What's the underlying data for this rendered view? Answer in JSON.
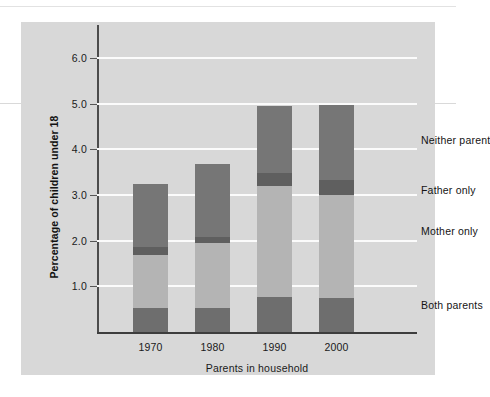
{
  "chart_data": {
    "type": "bar",
    "subtype": "stacked-bar",
    "title": "",
    "xlabel": "Parents in household",
    "ylabel": "Percentage of children under 18",
    "categories": [
      "1970",
      "1980",
      "1990",
      "2000"
    ],
    "ylim": [
      0,
      6.4
    ],
    "yticks": [
      "1.0",
      "2.0",
      "3.0",
      "4.0",
      "5.0",
      "6.0"
    ],
    "ytick_values": [
      1.0,
      2.0,
      3.0,
      4.0,
      5.0,
      6.0
    ],
    "grid": "horizontal-white",
    "legend_position": "right-inline",
    "series": [
      {
        "name": "Both parents",
        "color": "#6e6e6e",
        "values": [
          0.53,
          0.52,
          0.76,
          0.74
        ]
      },
      {
        "name": "Mother only",
        "color": "#b4b4b4",
        "values": [
          1.16,
          1.43,
          2.43,
          2.25
        ]
      },
      {
        "name": "Father only",
        "color": "#5f5f5f",
        "values": [
          0.17,
          0.12,
          0.3,
          0.33
        ]
      },
      {
        "name": "Neither parent",
        "color": "#767676",
        "values": [
          1.38,
          1.6,
          1.46,
          1.64
        ]
      }
    ],
    "cumulative_tops": {
      "1970": [
        0.53,
        1.69,
        1.86,
        3.24
      ],
      "1980": [
        0.52,
        1.95,
        2.07,
        3.67
      ],
      "1990": [
        0.76,
        3.19,
        3.49,
        4.95
      ],
      "2000": [
        0.74,
        2.99,
        3.32,
        4.96
      ]
    },
    "legend": [
      {
        "label": "Neither parent",
        "value_anchor": 4.2
      },
      {
        "label": "Father only",
        "value_anchor": 3.1
      },
      {
        "label": "Mother only",
        "value_anchor": 2.2
      },
      {
        "label": "Both parents",
        "value_anchor": 0.6
      }
    ]
  },
  "colors": {
    "panel_background": "#d8d8d8",
    "gridline": "#fbfbfb",
    "axis": "#3d3d3d",
    "text": "#1a1a1a"
  }
}
